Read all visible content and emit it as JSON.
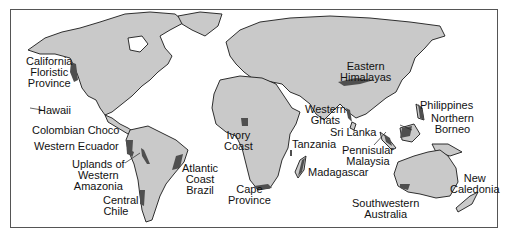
{
  "map": {
    "title": "Biodiversity hotspots world map",
    "colors": {
      "land": "#c9c9c9",
      "hotspot": "#4f4f4f",
      "outline": "#1a1a1a",
      "ocean": "#ffffff"
    },
    "hotspots": [
      {
        "id": "california",
        "lines": [
          "California",
          "Floristic",
          "Province"
        ]
      },
      {
        "id": "hawaii",
        "lines": [
          "Hawaii"
        ]
      },
      {
        "id": "colombian-choco",
        "lines": [
          "Colombian Choco"
        ]
      },
      {
        "id": "western-ecuador",
        "lines": [
          "Western Ecuador"
        ]
      },
      {
        "id": "uplands-western-amazonia",
        "lines": [
          "Uplands of",
          "Western",
          "Amazonia"
        ]
      },
      {
        "id": "central-chile",
        "lines": [
          "Central",
          "Chile"
        ]
      },
      {
        "id": "atlantic-coast-brazil",
        "lines": [
          "Atlantic",
          "Coast",
          "Brazil"
        ]
      },
      {
        "id": "ivory-coast",
        "lines": [
          "Ivory",
          "Coast"
        ]
      },
      {
        "id": "cape-province",
        "lines": [
          "Cape",
          "Province"
        ]
      },
      {
        "id": "tanzania",
        "lines": [
          "Tanzania"
        ]
      },
      {
        "id": "madagascar",
        "lines": [
          "Madagascar"
        ]
      },
      {
        "id": "western-ghats",
        "lines": [
          "Western",
          "Ghats"
        ]
      },
      {
        "id": "sri-lanka",
        "lines": [
          "Sri Lanka"
        ]
      },
      {
        "id": "eastern-himalayas",
        "lines": [
          "Eastern",
          "Himalayas"
        ]
      },
      {
        "id": "pennisular-malaysia",
        "lines": [
          "Pennisular",
          "Malaysia"
        ]
      },
      {
        "id": "philippines",
        "lines": [
          "Philippines"
        ]
      },
      {
        "id": "northern-borneo",
        "lines": [
          "Northern",
          "Borneo"
        ]
      },
      {
        "id": "southwestern-australia",
        "lines": [
          "Southwestern",
          "Australia"
        ]
      },
      {
        "id": "new-caledonia",
        "lines": [
          "New",
          "Caledonia"
        ]
      }
    ]
  }
}
